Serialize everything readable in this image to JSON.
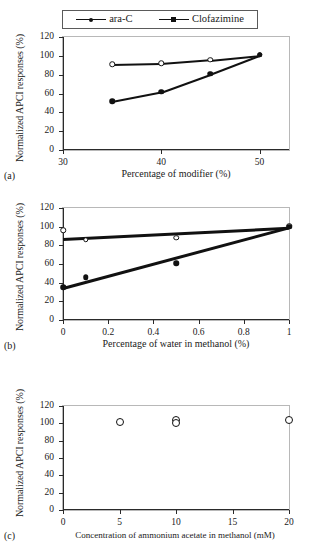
{
  "figure": {
    "shared_ylabel": "Normalized APCI responses (%)",
    "legend": {
      "items": [
        {
          "label": "ara-C",
          "marker": "open-circle-line"
        },
        {
          "label": "Clofazimine",
          "marker": "filled-square-line"
        }
      ]
    },
    "panel_tags": {
      "a": "(a)",
      "b": "(b)",
      "c": "(c)"
    }
  },
  "chart_data": [
    {
      "id": "a",
      "type": "scatter",
      "title": "",
      "xlabel": "Percentage of modifier (%)",
      "ylabel": "Normalized APCI responses (%)",
      "xlim": [
        30,
        53
      ],
      "ylim": [
        0,
        120
      ],
      "xticks": [
        30,
        40,
        50
      ],
      "yticks": [
        0,
        20,
        40,
        60,
        80,
        100,
        120
      ],
      "grid": false,
      "legend_position": "above-plot",
      "series": [
        {
          "name": "ara-C",
          "marker": "open-circle",
          "x": [
            35,
            40,
            45,
            50
          ],
          "values": [
            91,
            92,
            96,
            101
          ]
        },
        {
          "name": "Clofazimine",
          "marker": "filled-circle",
          "x": [
            35,
            40,
            45,
            50
          ],
          "values": [
            52,
            62,
            81,
            101
          ]
        }
      ]
    },
    {
      "id": "b",
      "type": "scatter",
      "title": "",
      "xlabel": "Percentage of water in methanol (%)",
      "ylabel": "Normalized APCI responses (%)",
      "xlim": [
        0,
        1
      ],
      "ylim": [
        0,
        120
      ],
      "xticks": [
        0,
        0.2,
        0.4,
        0.6,
        0.8,
        1
      ],
      "xtick_labels": [
        "0",
        "0.2",
        "0.4",
        "0.6",
        "0.8",
        "1"
      ],
      "yticks": [
        0,
        20,
        40,
        60,
        80,
        100,
        120
      ],
      "grid": false,
      "legend_position": "none",
      "series": [
        {
          "name": "ara-C",
          "marker": "open-circle",
          "x": [
            0,
            0.1,
            0.5,
            1
          ],
          "values": [
            96,
            86,
            88,
            101
          ]
        },
        {
          "name": "Clofazimine",
          "marker": "filled-circle",
          "x": [
            0,
            0.1,
            0.5,
            1
          ],
          "values": [
            35,
            46,
            61,
            100
          ]
        }
      ],
      "trendlines": [
        {
          "name": "ara-C trend",
          "x": [
            0,
            1
          ],
          "values": [
            88,
            100
          ]
        },
        {
          "name": "Clofazimine trend",
          "x": [
            0,
            1
          ],
          "values": [
            35,
            100
          ]
        }
      ]
    },
    {
      "id": "c",
      "type": "scatter",
      "title": "",
      "xlabel": "Concentration of ammonium acetate in methanol (mM)",
      "ylabel": "Normalized APCI responses (%)",
      "xlim": [
        0,
        20
      ],
      "ylim": [
        0,
        120
      ],
      "xticks": [
        0,
        5,
        10,
        15,
        20
      ],
      "yticks": [
        0,
        20,
        40,
        60,
        80,
        100,
        120
      ],
      "grid": false,
      "legend_position": "none",
      "series": [
        {
          "name": "ara-C",
          "marker": "open-circle",
          "x": [
            5,
            10,
            20
          ],
          "values": [
            101,
            104,
            104
          ]
        },
        {
          "name": "Clofazimine",
          "marker": "open-circle",
          "x": [
            10
          ],
          "values": [
            100
          ]
        }
      ]
    }
  ]
}
